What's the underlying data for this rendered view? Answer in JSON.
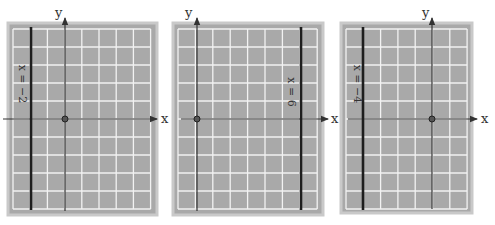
{
  "colors": {
    "panel_border": "#c9c9c9",
    "panel_fill": "#a9a9a9",
    "grid_line": "#f2f2f2",
    "axis": "#333333",
    "bold_line": "#1e1e1e"
  },
  "graphs": [
    {
      "id": "graph-1",
      "x_axis_label": "x",
      "y_axis_label": "y",
      "equation": "x = −2",
      "line_x_value": -2,
      "panel": {
        "x": 8,
        "y": 23,
        "w": 149,
        "h": 192
      },
      "grid": {
        "x": 13,
        "y": 29,
        "cols": 8,
        "rows": 10,
        "cw": 17.2,
        "rh": 18
      },
      "origin": {
        "x": 65,
        "y": 119
      },
      "bold_line_x": 31,
      "xaxis_from": 3,
      "xaxis_to": 157,
      "x_label_pos": {
        "x": 161,
        "y": 123
      },
      "y_label_pos": {
        "x": 55,
        "y": 17
      },
      "eq_pos": {
        "x": 22,
        "y": 84
      }
    },
    {
      "id": "graph-2",
      "x_axis_label": "x",
      "y_axis_label": "y",
      "equation": "x = 6",
      "line_x_value": 6,
      "panel": {
        "x": 173,
        "y": 23,
        "w": 150,
        "h": 192
      },
      "grid": {
        "x": 178,
        "y": 29,
        "cols": 8,
        "rows": 10,
        "cw": 17.4,
        "rh": 18
      },
      "origin": {
        "x": 197,
        "y": 119
      },
      "bold_line_x": 301,
      "xaxis_from": 181,
      "xaxis_to": 328,
      "x_label_pos": {
        "x": 331,
        "y": 123
      },
      "y_label_pos": {
        "x": 185,
        "y": 17
      },
      "eq_pos": {
        "x": 291,
        "y": 92
      }
    },
    {
      "id": "graph-3",
      "x_axis_label": "x",
      "y_axis_label": "y",
      "equation": "x = −4",
      "line_x_value": -4,
      "panel": {
        "x": 341,
        "y": 23,
        "w": 131,
        "h": 190
      },
      "grid": {
        "x": 346,
        "y": 29,
        "cols": 7,
        "rows": 10,
        "cw": 17.3,
        "rh": 18
      },
      "origin": {
        "x": 432,
        "y": 119
      },
      "bold_line_x": 363,
      "xaxis_from": 348,
      "xaxis_to": 477,
      "x_label_pos": {
        "x": 481,
        "y": 123
      },
      "y_label_pos": {
        "x": 422,
        "y": 17
      },
      "eq_pos": {
        "x": 357,
        "y": 84
      }
    }
  ],
  "stray_labels": [
    {
      "text": "x",
      "x": 330,
      "y": 123
    }
  ]
}
